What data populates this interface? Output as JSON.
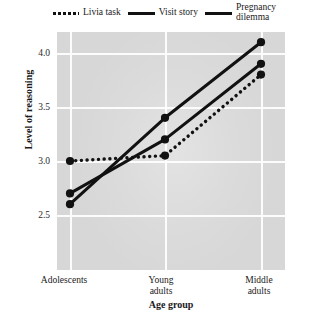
{
  "chart_data": {
    "type": "line",
    "title": "",
    "xlabel": "Age group",
    "ylabel": "Level of reasoning",
    "categories": [
      "Adolescents",
      "Young adults",
      "Middle adults"
    ],
    "ylim": [
      2.3,
      4.25
    ],
    "yticks": [
      "2.5",
      "3.0",
      "3.5",
      "4.0"
    ],
    "ytick_values": [
      2.5,
      3.0,
      3.5,
      4.0
    ],
    "grid": true,
    "legend_position": "top",
    "series": [
      {
        "name": "Livia task",
        "style": "dotted",
        "values": [
          3.0,
          3.05,
          3.8
        ]
      },
      {
        "name": "Visit story",
        "style": "solid",
        "values": [
          2.7,
          3.2,
          3.9
        ]
      },
      {
        "name": "Pregnancy\ndilemma",
        "style": "solid",
        "values": [
          2.6,
          3.4,
          4.1
        ]
      }
    ]
  },
  "legend": {
    "items": [
      {
        "label": "Livia task",
        "style": "dotted"
      },
      {
        "label": "Visit story",
        "style": "solid"
      },
      {
        "label": "Pregnancy\ndilemma",
        "style": "solid"
      }
    ]
  },
  "axes": {
    "y_title": "Level of reasoning",
    "x_title": "Age group",
    "y_ticks": [
      "4.0",
      "3.5",
      "3.0",
      "2.5"
    ],
    "x_ticks": [
      "Adolescents",
      "Young\nadults",
      "Middle\nadults"
    ]
  },
  "colors": {
    "plot_background": "#d7d7d7",
    "gridline": "#fcfcfc",
    "series_line": "#111111",
    "text": "#1a1a1a"
  }
}
